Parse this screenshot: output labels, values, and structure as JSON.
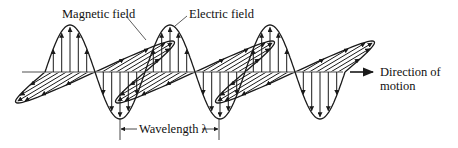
{
  "figure": {
    "type": "electromagnetic-wave-diagram",
    "labels": {
      "magnetic": "Magnetic field",
      "electric": "Electric field",
      "direction_line1": "Direction of",
      "direction_line2": "motion",
      "wavelength": "Wavelength λ"
    },
    "colors": {
      "ink": "#1a1a1a",
      "axis": "#8a8a8a",
      "background": "#ffffff"
    },
    "geometry": {
      "axis_y": 72,
      "axis_x_start": 22,
      "axis_x_end": 343,
      "wave_start_x": 45,
      "half_wavelength_px": 50,
      "electric_amplitude_px": 47,
      "magnetic_dx": 52,
      "magnetic_dy": 31,
      "cycles": 3,
      "wavelength_bracket": {
        "x1": 120,
        "x2": 219,
        "y": 128
      }
    }
  }
}
